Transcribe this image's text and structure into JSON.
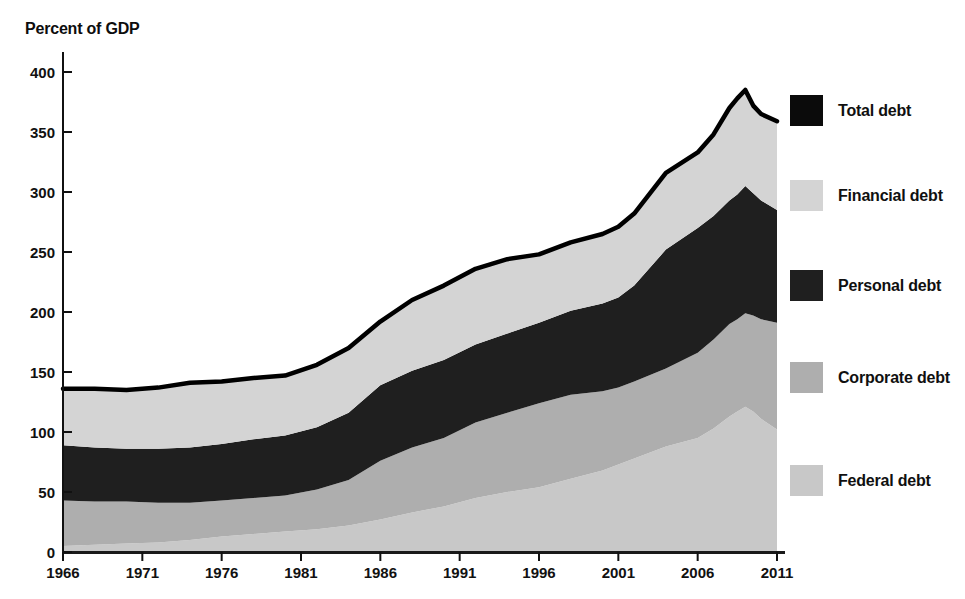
{
  "title": "Percent of GDP",
  "legend": [
    {
      "label": "Total debt",
      "color": "#0b0b0b"
    },
    {
      "label": "Financial debt",
      "color": "#d4d4d4"
    },
    {
      "label": "Personal debt",
      "color": "#1f1f1f"
    },
    {
      "label": "Corporate debt",
      "color": "#aeaeae"
    },
    {
      "label": "Federal debt",
      "color": "#c8c8c8"
    }
  ],
  "chart_data": {
    "type": "area",
    "stacked": true,
    "title": "Percent of GDP",
    "xlabel": "",
    "ylabel": "Percent of GDP",
    "xlim": [
      1966,
      2011
    ],
    "ylim": [
      0,
      400
    ],
    "grid": false,
    "legend_position": "right",
    "x_ticks": [
      1966,
      1971,
      1976,
      1981,
      1986,
      1991,
      1996,
      2001,
      2006,
      2011
    ],
    "y_ticks": [
      0,
      50,
      100,
      150,
      200,
      250,
      300,
      350,
      400
    ],
    "x": [
      1966,
      1968,
      1970,
      1972,
      1974,
      1976,
      1978,
      1980,
      1982,
      1984,
      1986,
      1988,
      1990,
      1992,
      1994,
      1996,
      1998,
      2000,
      2001,
      2002,
      2004,
      2006,
      2007,
      2008,
      2008.5,
      2009,
      2009.5,
      2010,
      2011
    ],
    "series": [
      {
        "name": "Federal debt",
        "color": "#c8c8c8",
        "values": [
          5,
          6,
          7,
          8,
          10,
          13,
          15,
          17,
          19,
          22,
          27,
          33,
          38,
          45,
          50,
          54,
          61,
          68,
          73,
          78,
          88,
          95,
          103,
          113,
          117,
          121,
          117,
          111,
          102
        ]
      },
      {
        "name": "Corporate debt",
        "color": "#aeaeae",
        "values": [
          38,
          36,
          35,
          33,
          31,
          30,
          30,
          30,
          33,
          38,
          49,
          54,
          57,
          63,
          66,
          70,
          70,
          66,
          64,
          64,
          65,
          71,
          74,
          77,
          77,
          78,
          80,
          83,
          89
        ]
      },
      {
        "name": "Personal debt",
        "color": "#1f1f1f",
        "values": [
          46,
          45,
          44,
          45,
          46,
          47,
          49,
          50,
          52,
          56,
          63,
          64,
          65,
          65,
          66,
          67,
          70,
          73,
          75,
          80,
          99,
          104,
          103,
          103,
          104,
          106,
          102,
          99,
          94
        ]
      },
      {
        "name": "Financial debt",
        "color": "#d4d4d4",
        "values": [
          47,
          49,
          49,
          51,
          54,
          52,
          51,
          50,
          52,
          54,
          53,
          59,
          62,
          63,
          62,
          57,
          57,
          58,
          59,
          60,
          64,
          63,
          68,
          77,
          80,
          80,
          73,
          72,
          74
        ]
      }
    ],
    "total_line": {
      "name": "Total debt",
      "color": "#000000",
      "is_sum_of_series": true,
      "values": [
        136,
        136,
        135,
        137,
        141,
        142,
        145,
        147,
        156,
        170,
        192,
        210,
        222,
        236,
        244,
        248,
        258,
        265,
        271,
        282,
        316,
        333,
        348,
        370,
        378,
        385,
        372,
        365,
        359
      ]
    }
  }
}
